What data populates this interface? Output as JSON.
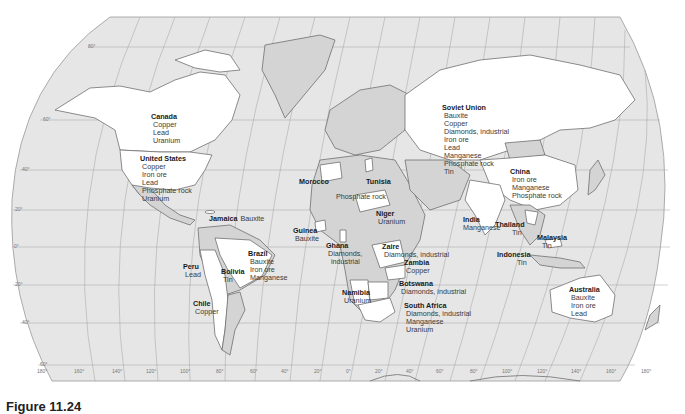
{
  "caption": "Figure 11.24",
  "colors": {
    "ocean": "#e6e6e6",
    "land_producer": "#ffffff",
    "land_other": "#d4d4d4",
    "grid": "#9a9a9a",
    "coast": "#707070"
  },
  "latitude_labels": [
    "80°",
    "60°",
    "40°",
    "20°",
    "0°",
    "20°",
    "40°",
    "60°"
  ],
  "longitude_labels": [
    "180°",
    "160°",
    "140°",
    "120°",
    "100°",
    "80°",
    "60°",
    "40°",
    "20°",
    "0°",
    "20°",
    "40°",
    "60°",
    "80°",
    "100°",
    "120°",
    "140°",
    "160°",
    "180°"
  ],
  "countries": [
    {
      "name": "Canada",
      "resources": [
        "Copper",
        "Lead",
        "Uranium"
      ]
    },
    {
      "name": "United States",
      "resources": [
        "Copper",
        "Iron ore",
        "Lead",
        "Phosphate rock",
        "Uranium"
      ]
    },
    {
      "name": "Jamaica",
      "resources": [
        "Bauxite"
      ]
    },
    {
      "name": "Peru",
      "resources": [
        "Lead"
      ]
    },
    {
      "name": "Bolivia",
      "resources": [
        "Tin"
      ]
    },
    {
      "name": "Brazil",
      "resources": [
        "Bauxite",
        "Iron ore",
        "Manganese"
      ]
    },
    {
      "name": "Chile",
      "resources": [
        "Copper"
      ]
    },
    {
      "name": "Morocco",
      "resources": []
    },
    {
      "name": "Tunisia",
      "resources": [
        "Phosphate rock"
      ]
    },
    {
      "name": "Niger",
      "resources": [
        "Uranium"
      ]
    },
    {
      "name": "Guinea",
      "resources": [
        "Bauxite"
      ]
    },
    {
      "name": "Ghana",
      "resources": [
        "Diamonds,",
        "industrial"
      ]
    },
    {
      "name": "Zaire",
      "resources": [
        "Diamonds, industrial"
      ]
    },
    {
      "name": "Zambia",
      "resources": [
        "Copper"
      ]
    },
    {
      "name": "Namibia",
      "resources": [
        "Uranium"
      ]
    },
    {
      "name": "Botswana",
      "resources": [
        "Diamonds, industrial"
      ]
    },
    {
      "name": "South Africa",
      "resources": [
        "Diamonds, industrial",
        "Manganese",
        "Uranium"
      ]
    },
    {
      "name": "Soviet Union",
      "resources": [
        "Bauxite",
        "Copper",
        "Diamonds, industrial",
        "Iron ore",
        "Lead",
        "Manganese",
        "Phosphate rock",
        "Tin"
      ]
    },
    {
      "name": "China",
      "resources": [
        "Iron ore",
        "Manganese",
        "Phosphate rock"
      ]
    },
    {
      "name": "India",
      "resources": [
        "Manganese"
      ]
    },
    {
      "name": "Thailand",
      "resources": [
        "Tin"
      ]
    },
    {
      "name": "Malaysia",
      "resources": [
        "Tin"
      ]
    },
    {
      "name": "Indonesia",
      "resources": [
        "Tin"
      ]
    },
    {
      "name": "Australia",
      "resources": [
        "Bauxite",
        "Iron ore",
        "Lead"
      ]
    }
  ]
}
